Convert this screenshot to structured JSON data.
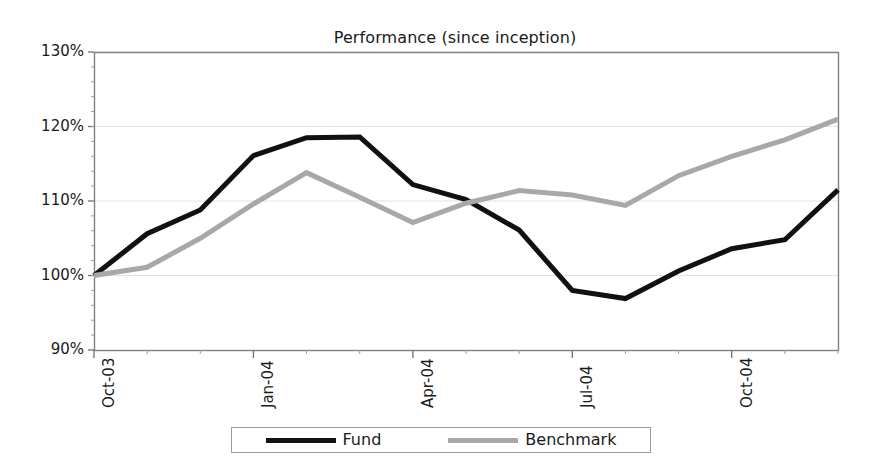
{
  "chart_data": {
    "type": "line",
    "title": "Performance (since inception)",
    "xlabel": "",
    "ylabel": "",
    "ylim": [
      90,
      130
    ],
    "ytick_values": [
      90,
      100,
      110,
      120,
      130
    ],
    "ytick_labels": [
      "90%",
      "100%",
      "110%",
      "120%",
      "130%"
    ],
    "grid": true,
    "legend_position": "bottom",
    "x": [
      "Oct-03",
      "Nov-03",
      "Dec-03",
      "Jan-04",
      "Feb-04",
      "Mar-04",
      "Apr-04",
      "May-04",
      "Jun-04",
      "Jul-04",
      "Aug-04",
      "Sep-04",
      "Oct-04",
      "Nov-04",
      "Dec-04"
    ],
    "xtick_labels": [
      "Oct-03",
      "Jan-04",
      "Apr-04",
      "Jul-04",
      "Oct-04"
    ],
    "xtick_index": [
      0,
      3,
      6,
      9,
      12
    ],
    "series": [
      {
        "name": "Fund",
        "color": "#111111",
        "values": [
          100.0,
          105.6,
          108.8,
          116.1,
          118.5,
          118.6,
          112.2,
          110.2,
          106.1,
          98.0,
          96.9,
          100.6,
          103.6,
          104.8,
          111.5
        ]
      },
      {
        "name": "Benchmark",
        "color": "#a8a8a8",
        "values": [
          100.0,
          101.1,
          105.0,
          109.6,
          113.8,
          110.5,
          107.1,
          109.7,
          111.4,
          110.8,
          109.4,
          113.4,
          116.0,
          118.2,
          121.0
        ]
      }
    ]
  },
  "legend": {
    "entries": [
      {
        "label": "Fund",
        "color": "#111111"
      },
      {
        "label": "Benchmark",
        "color": "#a8a8a8"
      }
    ]
  },
  "axes": {
    "frame_color": "#808080",
    "gridline_color": "#e2e2e2"
  }
}
